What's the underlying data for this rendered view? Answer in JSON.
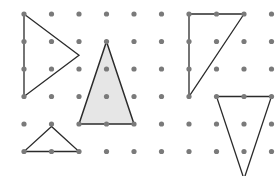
{
  "figure": {
    "name": "geoboard-triangles",
    "width": 278,
    "height": 176,
    "background_color": "#ffffff"
  },
  "grid": {
    "name": "dot-lattice",
    "columns": 10,
    "rows": 6,
    "origin_x": 24,
    "origin_y": 14,
    "spacing_x": 27.5,
    "spacing_y": 27.5,
    "dot_radius": 2.6,
    "dot_color": "#7a7a7a"
  },
  "shapes": [
    {
      "id": "triangle-left-pointing-right",
      "label": "Triangle A",
      "fill": "none",
      "stroke": "#2b2b2b",
      "stroke_width": 1.3,
      "vertices_grid": [
        [
          0,
          0
        ],
        [
          0,
          3
        ],
        [
          2,
          1.5
        ]
      ],
      "points": "24,14 24,96.5 79,55.25"
    },
    {
      "id": "triangle-shaded-tall",
      "label": "Triangle B",
      "fill": "#e6e6e6",
      "stroke": "#2b2b2b",
      "stroke_width": 1.5,
      "vertices_grid": [
        [
          3,
          1
        ],
        [
          2,
          4
        ],
        [
          4,
          4
        ]
      ],
      "points": "106.5,41.5 79,124 134,124"
    },
    {
      "id": "triangle-right-angle-upper-right",
      "label": "Triangle C",
      "fill": "none",
      "stroke": "#2b2b2b",
      "stroke_width": 1.3,
      "vertices_grid": [
        [
          6,
          0
        ],
        [
          8,
          0
        ],
        [
          6,
          3
        ]
      ],
      "points": "189,14 244,14 189,96.5"
    },
    {
      "id": "triangle-inverted-lower-right",
      "label": "Triangle D",
      "fill": "none",
      "stroke": "#2b2b2b",
      "stroke_width": 1.3,
      "vertices_grid": [
        [
          7,
          3
        ],
        [
          9,
          3
        ],
        [
          8,
          6
        ]
      ],
      "points": "216.5,96.5 271.5,96.5 244,179"
    },
    {
      "id": "triangle-small-lower-left",
      "label": "Triangle E",
      "fill": "none",
      "stroke": "#2b2b2b",
      "stroke_width": 1.3,
      "vertices_grid": [
        [
          1,
          4.1
        ],
        [
          0,
          5
        ],
        [
          2,
          5
        ]
      ],
      "points": "51.5,126.5 24,151.5 79,151.5"
    }
  ]
}
